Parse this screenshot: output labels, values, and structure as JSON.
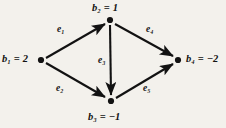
{
  "figure": {
    "type": "directed-graph",
    "background_color": "#f3f1ec",
    "ink_color": "#121212"
  },
  "nodes": [
    {
      "id": "b1",
      "label": "b₁ = 2",
      "x": 41,
      "y": 60,
      "value": 2
    },
    {
      "id": "b2",
      "label": "b₂ = 1",
      "x": 110,
      "y": 20,
      "value": 1
    },
    {
      "id": "b3",
      "label": "b₃ = −1",
      "x": 111,
      "y": 101,
      "value": -1
    },
    {
      "id": "b4",
      "label": "b₄ = −2",
      "x": 178,
      "y": 60,
      "value": -2
    }
  ],
  "edges": [
    {
      "id": "e1",
      "label": "e₁",
      "from": "b1",
      "to": "b2"
    },
    {
      "id": "e2",
      "label": "e₂",
      "from": "b1",
      "to": "b3"
    },
    {
      "id": "e3",
      "label": "e₃",
      "from": "b2",
      "to": "b3"
    },
    {
      "id": "e4",
      "label": "e₄",
      "from": "b2",
      "to": "b4"
    },
    {
      "id": "e5",
      "label": "e₅",
      "from": "b3",
      "to": "b4"
    }
  ]
}
